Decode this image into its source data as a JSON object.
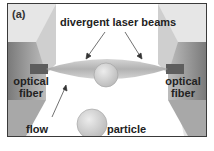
{
  "figure": {
    "panel_label": "(a)",
    "labels": {
      "beams": "divergent laser beams",
      "fiber_left_line1": "optical",
      "fiber_left_line2": "fiber",
      "fiber_right_line1": "optical",
      "fiber_right_line2": "fiber",
      "flow": "flow",
      "particle": "particle"
    },
    "colors": {
      "frame": "#3a3a3a",
      "fiber_dark": "#6e6e6e",
      "fiber_mid": "#9a9a9a",
      "fiber_light": "#d8d8d8",
      "beam": "#b8b8b8",
      "particle": "#d4d4d4",
      "text": "#222222"
    }
  }
}
